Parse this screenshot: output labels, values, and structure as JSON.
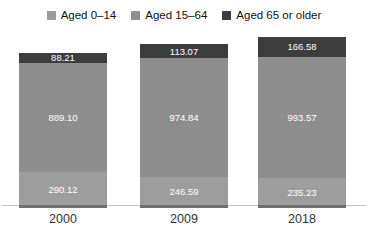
{
  "legend": {
    "items": [
      {
        "label": "Aged 0–14",
        "color": "#9d9d9d"
      },
      {
        "label": "Aged 15–64",
        "color": "#8e8e8e"
      },
      {
        "label": "Aged 65 or older",
        "color": "#3d3d3d"
      }
    ]
  },
  "chart_data": {
    "type": "bar",
    "stacked": true,
    "title": "",
    "xlabel": "",
    "ylabel": "",
    "categories": [
      "2000",
      "2009",
      "2018"
    ],
    "series": [
      {
        "name": "Aged 0–14",
        "color": "#9d9d9d",
        "values": [
          290.12,
          246.59,
          235.23
        ]
      },
      {
        "name": "Aged 15–64",
        "color": "#8e8e8e",
        "values": [
          889.1,
          974.84,
          993.57
        ]
      },
      {
        "name": "Aged 65 or older",
        "color": "#3d3d3d",
        "values": [
          88.21,
          113.07,
          166.58
        ]
      }
    ],
    "totals": [
      1267.43,
      1334.5,
      1395.38
    ],
    "value_labels": true,
    "value_label_color": "#ffffff",
    "legend_position": "top",
    "grid": false,
    "axis_line_color": "#c2c2c2",
    "bar_base_strip_color": "#6f6f6f",
    "x_tick_label_color": "#333333"
  }
}
